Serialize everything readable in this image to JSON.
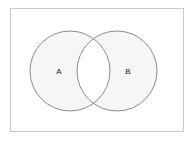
{
  "figure": {
    "type": "venn-diagram",
    "title": "",
    "frame": {
      "border_color": "#c8c8c8",
      "background_color": "#ffffff",
      "x": 10,
      "y": 8,
      "width": 174,
      "height": 124
    }
  },
  "chart_data": {
    "type": "venn",
    "title": "",
    "xlabel": "",
    "ylabel": "",
    "grid": false,
    "legend": "none",
    "set_count": 2,
    "sets": [
      {
        "id": "A",
        "label": "A",
        "label_x": 59,
        "label_y": 71,
        "center_x": 70,
        "center_y": 71,
        "radius": 40,
        "fill": "#f6f6f6",
        "stroke": "#8c8c8c",
        "stroke_width": 1
      },
      {
        "id": "B",
        "label": "B",
        "label_x": 128,
        "label_y": 71,
        "center_x": 117,
        "center_y": 71,
        "radius": 40,
        "fill": "#f6f6f6",
        "stroke": "#8c8c8c",
        "stroke_width": 1
      }
    ],
    "intersection": {
      "label": "",
      "fill": "#ffffff",
      "shaded": false,
      "description": "A and B overlap; lens-shaped intersection region is unshaded (white)"
    },
    "colors": {
      "set_fill": "#f6f6f6",
      "set_stroke": "#8c8c8c",
      "intersection_fill": "#ffffff",
      "label_color": "#222222",
      "frame_border": "#c8c8c8",
      "background": "#ffffff"
    }
  }
}
